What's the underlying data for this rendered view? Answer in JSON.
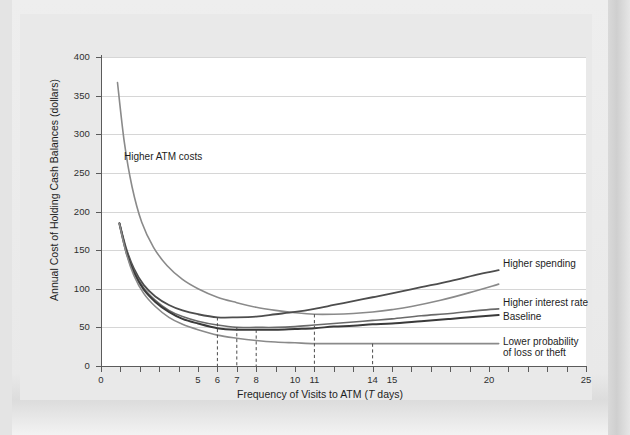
{
  "chart_data": {
    "type": "line",
    "title": "",
    "xlabel": "Frequency of Visits to ATM (T days)",
    "ylabel": "Annual Cost of Holding Cash Balances (dollars)",
    "xlim": [
      0,
      25
    ],
    "ylim": [
      0,
      400
    ],
    "grid": true,
    "legend_position": "right-of-curves",
    "y_ticks": [
      0,
      50,
      100,
      150,
      200,
      250,
      300,
      350,
      400
    ],
    "x_ticks": [
      0,
      5,
      6,
      7,
      8,
      10,
      11,
      14,
      15,
      20,
      25
    ],
    "x_ticks_labeled": [
      "0",
      "5",
      "6",
      "7",
      "8",
      "10",
      "11",
      "14",
      "15",
      "20",
      "25"
    ],
    "annotations": [
      {
        "text": "Higher ATM costs",
        "x": 2.2,
        "y": 262
      },
      {
        "text": "Higher spending",
        "x": 20.5,
        "y": 127
      },
      {
        "text": "Higher interest rate",
        "x": 20.5,
        "y": 78
      },
      {
        "text": "Baseline",
        "x": 20.5,
        "y": 62
      },
      {
        "text": "Lower probability",
        "x": 20.5,
        "y": 32
      },
      {
        "text": "of loss or theft",
        "x": 20.5,
        "y": 20
      }
    ],
    "minimum_markers": [
      {
        "series": "Higher spending",
        "x": 6,
        "y": 63
      },
      {
        "series": "Higher interest rate",
        "x": 7,
        "y": 50
      },
      {
        "series": "Baseline",
        "x": 8,
        "y": 47
      },
      {
        "series": "Higher ATM costs",
        "x": 11,
        "y": 67
      },
      {
        "series": "Lower probability of loss or theft",
        "x": 14,
        "y": 29
      }
    ],
    "series": [
      {
        "name": "Higher ATM costs",
        "color": "#8a8a8a",
        "width": 1.6,
        "x": [
          0.85,
          1.2,
          1.6,
          2.1,
          2.7,
          3.4,
          4.2,
          5.0,
          6.0,
          7.0,
          8.0,
          9.0,
          10.0,
          11.0,
          12.0,
          13.0,
          14.0,
          15.0,
          16.0,
          17.5,
          19.0,
          20.5
        ],
        "y": [
          367,
          290,
          232,
          186,
          154,
          130,
          112,
          100,
          89,
          82,
          76,
          72,
          69,
          67,
          67,
          68,
          70,
          73,
          77,
          85,
          95,
          106
        ]
      },
      {
        "name": "Higher spending",
        "color": "#4d4d4d",
        "width": 1.8,
        "x": [
          0.95,
          1.3,
          1.7,
          2.2,
          2.8,
          3.5,
          4.2,
          5.0,
          6.0,
          7.0,
          8.0,
          9.0,
          10.0,
          11.0,
          12.0,
          13.0,
          14.0,
          15.0,
          16.5,
          18.0,
          19.5,
          20.5
        ],
        "y": [
          185,
          152,
          126,
          105,
          90,
          79,
          72,
          67,
          63,
          63,
          64,
          67,
          70,
          74,
          79,
          84,
          89,
          94,
          102,
          110,
          119,
          124
        ]
      },
      {
        "name": "Higher interest rate",
        "color": "#6a6a6a",
        "width": 1.6,
        "x": [
          0.95,
          1.3,
          1.7,
          2.2,
          2.8,
          3.5,
          4.2,
          5.0,
          6.0,
          7.0,
          8.0,
          9.0,
          10.0,
          11.0,
          12.0,
          13.0,
          14.0,
          15.0,
          16.5,
          18.0,
          19.5,
          20.5
        ],
        "y": [
          185,
          150,
          123,
          101,
          85,
          72,
          64,
          58,
          53,
          50,
          50,
          50,
          51,
          53,
          55,
          57,
          59,
          61,
          65,
          68,
          72,
          74
        ]
      },
      {
        "name": "Baseline",
        "color": "#3a3a3a",
        "width": 2.0,
        "x": [
          0.95,
          1.3,
          1.7,
          2.2,
          2.8,
          3.5,
          4.2,
          5.0,
          6.0,
          7.0,
          8.0,
          9.0,
          10.0,
          11.0,
          12.0,
          13.0,
          14.0,
          15.0,
          16.5,
          18.0,
          19.5,
          20.5
        ],
        "y": [
          184,
          148,
          121,
          99,
          83,
          70,
          61,
          55,
          49,
          47,
          47,
          47,
          48,
          49,
          51,
          52,
          54,
          55,
          58,
          61,
          64,
          66
        ]
      },
      {
        "name": "Lower probability of loss or theft",
        "color": "#8a8a8a",
        "width": 1.6,
        "x": [
          0.95,
          1.3,
          1.7,
          2.2,
          2.8,
          3.5,
          4.2,
          5.0,
          6.0,
          7.0,
          8.0,
          9.0,
          10.0,
          11.0,
          12.0,
          13.0,
          14.0,
          15.0,
          16.5,
          18.0,
          19.5,
          20.5
        ],
        "y": [
          184,
          146,
          117,
          94,
          77,
          63,
          54,
          47,
          40,
          36,
          33,
          31,
          30,
          29,
          29,
          29,
          29,
          29,
          29,
          29,
          29,
          29
        ]
      }
    ]
  },
  "axis": {
    "ylabel": "Annual Cost of Holding Cash Balances (dollars)",
    "xlabel": "Frequency of Visits to ATM (T days)",
    "y0": "0",
    "y50": "50",
    "y100": "100",
    "y150": "150",
    "y200": "200",
    "y250": "250",
    "y300": "300",
    "y350": "350",
    "y400": "400",
    "x0": "0",
    "x5": "5",
    "x6": "6",
    "x7": "7",
    "x8": "8",
    "x10": "10",
    "x11": "11",
    "x14": "14",
    "x15": "15",
    "x20": "20",
    "x25": "25"
  },
  "labels": {
    "higher_atm_costs": "Higher ATM costs",
    "higher_spending": "Higher spending",
    "higher_interest_rate": "Higher interest rate",
    "baseline": "Baseline",
    "lower_probability_line1": "Lower probability",
    "lower_probability_line2": "of loss or theft"
  }
}
